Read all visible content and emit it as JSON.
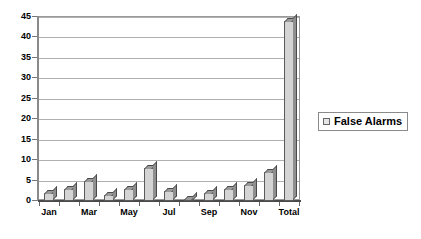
{
  "chart_data": {
    "type": "bar",
    "title": "",
    "subtitle": "",
    "xlabel": "",
    "ylabel": "",
    "ylim": [
      0,
      45
    ],
    "y_ticks": [
      0,
      5,
      10,
      15,
      20,
      25,
      30,
      35,
      40,
      45
    ],
    "grid": true,
    "legend_position": "right",
    "categories": [
      "Jan",
      "Feb",
      "Mar",
      "Apr",
      "May",
      "Jun",
      "Jul",
      "Aug",
      "Sep",
      "Oct",
      "Nov",
      "Dec",
      "Total"
    ],
    "visible_tick_labels": [
      "Jan",
      "",
      "Mar",
      "",
      "May",
      "",
      "Jul",
      "",
      "Sep",
      "",
      "Nov",
      "",
      "Total"
    ],
    "series": [
      {
        "name": "False Alarms",
        "color": "#d4d4d4",
        "values": [
          2,
          3,
          5,
          1.5,
          3,
          8,
          2.5,
          0.3,
          2,
          3,
          4,
          7,
          44
        ]
      }
    ]
  },
  "legend": {
    "entries": [
      {
        "label": "False Alarms",
        "swatch_color": "#e6e6e6",
        "swatch_icon": "legend-swatch-icon"
      }
    ]
  },
  "axes": {
    "y": {
      "labels": [
        "45",
        "40",
        "35",
        "30",
        "25",
        "20",
        "15",
        "10",
        "5",
        "0"
      ]
    },
    "x": {
      "labels": [
        "Jan",
        "Mar",
        "May",
        "Jul",
        "Sep",
        "Nov",
        "Total"
      ]
    }
  },
  "colors": {
    "bar_face": "#d4d4d4",
    "bar_top": "#9a9a9a",
    "bar_side": "#8f8f8f",
    "bar_border": "#5a5a5a",
    "gridline": "#b0b0b0",
    "axis": "#8a8a8a",
    "text": "#000000",
    "background": "#ffffff"
  }
}
